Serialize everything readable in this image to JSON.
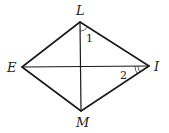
{
  "figure": {
    "type": "quadrilateral-with-diagonals",
    "vertices": {
      "L": {
        "label": "L",
        "x": 80,
        "y": 22
      },
      "E": {
        "label": "E",
        "x": 22,
        "y": 67
      },
      "I": {
        "label": "I",
        "x": 149,
        "y": 66
      },
      "M": {
        "label": "M",
        "x": 81,
        "y": 111
      }
    },
    "sides": [
      "LI",
      "IM",
      "ME",
      "EL"
    ],
    "diagonals": [
      "LM",
      "EI"
    ],
    "angles": [
      {
        "label": "1",
        "vertex": "L",
        "between": [
          "LM",
          "LI"
        ],
        "arcs": 1
      },
      {
        "label": "2",
        "vertex": "I",
        "between": [
          "IE",
          "IM"
        ],
        "arcs": 2
      }
    ],
    "colors": {
      "stroke": "#1a1a1a",
      "background": "#ffffff"
    }
  }
}
